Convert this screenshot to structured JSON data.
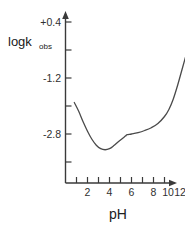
{
  "chart_data": {
    "type": "line",
    "title": "",
    "xlabel": "pH",
    "ylabel": "logk",
    "ylabel_sub": "obs",
    "xlim": [
      0,
      13
    ],
    "ylim": [
      -3.8,
      0.9
    ],
    "grid": false,
    "legend": null,
    "xticks": [
      1,
      2,
      3,
      4,
      5,
      6,
      7,
      8,
      9,
      10,
      11,
      12
    ],
    "xtick_labels": [
      "",
      "2",
      "",
      "4",
      "",
      "6",
      "",
      "8",
      "",
      "10",
      "",
      "12"
    ],
    "yticks": [
      0.4,
      -0.4,
      -1.2,
      -2.0,
      -2.8,
      -3.6
    ],
    "ytick_labels": [
      "+0.4",
      "",
      "-1.2",
      "",
      "-2.8",
      ""
    ],
    "series": [
      {
        "name": "log k obs vs pH",
        "x": [
          0.8,
          1.2,
          1.6,
          2.0,
          2.4,
          2.8,
          3.2,
          3.6,
          4.0,
          4.4,
          4.8,
          5.2,
          5.45,
          5.6,
          6.0,
          6.6,
          7.2,
          7.8,
          8.4,
          9.0,
          9.4,
          9.8,
          10.2,
          10.6,
          11.0,
          11.4,
          11.7
        ],
        "y": [
          -1.9,
          -2.15,
          -2.45,
          -2.72,
          -2.95,
          -3.12,
          -3.22,
          -3.25,
          -3.22,
          -3.13,
          -3.02,
          -2.92,
          -2.86,
          -2.82,
          -2.8,
          -2.76,
          -2.7,
          -2.62,
          -2.5,
          -2.3,
          -2.1,
          -1.8,
          -1.4,
          -0.95,
          -0.5,
          -0.05,
          0.38
        ]
      }
    ]
  },
  "axis_labels": {
    "x_title": "pH",
    "y_title_main": "logk",
    "y_title_sub": "obs"
  },
  "tick_text": {
    "y_top": "+0.4",
    "y_mid": "-1.2",
    "y_low": "-2.8",
    "x1": "2",
    "x2": "4",
    "x3": "6",
    "x4": "8",
    "x5": "10",
    "x6": "12"
  }
}
